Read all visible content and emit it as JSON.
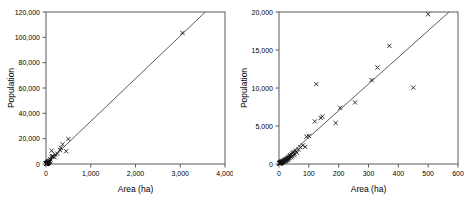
{
  "figure": {
    "panel_count": 2,
    "background_color": "#ffffff",
    "axis_color": "#5a5a5a",
    "marker_color": "#111111",
    "line_color": "#4a4a4a"
  },
  "chart_data": [
    {
      "type": "scatter",
      "title": "",
      "xlabel": "Area (ha)",
      "ylabel": "Population",
      "xlim": [
        0,
        4000
      ],
      "ylim": [
        0,
        120000
      ],
      "xticks": [
        0,
        1000,
        2000,
        3000,
        4000
      ],
      "xticklabels": [
        "0",
        "1,000",
        "2,000",
        "3,000",
        "4,000"
      ],
      "yticks": [
        0,
        20000,
        40000,
        60000,
        80000,
        100000,
        120000
      ],
      "yticklabels": [
        "0",
        "20,000",
        "40,000",
        "60,000",
        "80,000",
        "100,000",
        "120,000"
      ],
      "grid": false,
      "legend": false,
      "marker": "x",
      "fit_line": {
        "type": "linear",
        "x_start": 0,
        "y_start": 0,
        "x_end": 3560,
        "y_end": 120000,
        "slope": 33.7,
        "intercept": 0
      },
      "points": [
        {
          "x": 3050,
          "y": 103500
        },
        {
          "x": 500,
          "y": 19700
        },
        {
          "x": 370,
          "y": 15550
        },
        {
          "x": 450,
          "y": 10050
        },
        {
          "x": 330,
          "y": 12700
        },
        {
          "x": 310,
          "y": 11050
        },
        {
          "x": 255,
          "y": 8100
        },
        {
          "x": 205,
          "y": 7400
        },
        {
          "x": 190,
          "y": 5400
        },
        {
          "x": 145,
          "y": 6250
        },
        {
          "x": 140,
          "y": 6050
        },
        {
          "x": 125,
          "y": 10500
        },
        {
          "x": 120,
          "y": 5600
        },
        {
          "x": 100,
          "y": 3700
        },
        {
          "x": 92,
          "y": 3600
        },
        {
          "x": 88,
          "y": 2250
        },
        {
          "x": 80,
          "y": 2450
        },
        {
          "x": 72,
          "y": 2200
        },
        {
          "x": 66,
          "y": 1900
        },
        {
          "x": 60,
          "y": 1500
        },
        {
          "x": 56,
          "y": 1750
        },
        {
          "x": 52,
          "y": 1350
        },
        {
          "x": 50,
          "y": 1150
        },
        {
          "x": 46,
          "y": 1400
        },
        {
          "x": 44,
          "y": 1000
        },
        {
          "x": 40,
          "y": 900
        },
        {
          "x": 36,
          "y": 1050
        },
        {
          "x": 34,
          "y": 700
        },
        {
          "x": 30,
          "y": 800
        },
        {
          "x": 28,
          "y": 600
        },
        {
          "x": 25,
          "y": 650
        },
        {
          "x": 22,
          "y": 480
        },
        {
          "x": 20,
          "y": 520
        },
        {
          "x": 18,
          "y": 380
        },
        {
          "x": 16,
          "y": 420
        },
        {
          "x": 14,
          "y": 300
        },
        {
          "x": 12,
          "y": 330
        },
        {
          "x": 10,
          "y": 250
        },
        {
          "x": 9,
          "y": 280
        },
        {
          "x": 8,
          "y": 200
        },
        {
          "x": 7,
          "y": 220
        },
        {
          "x": 6,
          "y": 160
        },
        {
          "x": 5,
          "y": 180
        },
        {
          "x": 4,
          "y": 120
        },
        {
          "x": 3,
          "y": 140
        },
        {
          "x": 2,
          "y": 90
        },
        {
          "x": 1.5,
          "y": 70
        }
      ]
    },
    {
      "type": "scatter",
      "title": "",
      "xlabel": "Area (ha)",
      "ylabel": "Population",
      "xlim": [
        0,
        600
      ],
      "ylim": [
        0,
        20000
      ],
      "xticks": [
        0,
        100,
        200,
        300,
        400,
        500,
        600
      ],
      "xticklabels": [
        "0",
        "100",
        "200",
        "300",
        "400",
        "500",
        "600"
      ],
      "yticks": [
        0,
        5000,
        10000,
        15000,
        20000
      ],
      "yticklabels": [
        "0",
        "5,000",
        "10,000",
        "15,000",
        "20,000"
      ],
      "grid": false,
      "legend": false,
      "marker": "x",
      "fit_line": {
        "type": "linear",
        "x_start": 0,
        "y_start": 0,
        "x_end": 570,
        "y_end": 20000,
        "slope": 35.1,
        "intercept": 0
      },
      "points": [
        {
          "x": 500,
          "y": 19700
        },
        {
          "x": 370,
          "y": 15550
        },
        {
          "x": 450,
          "y": 10050
        },
        {
          "x": 330,
          "y": 12700
        },
        {
          "x": 310,
          "y": 11050
        },
        {
          "x": 255,
          "y": 8100
        },
        {
          "x": 205,
          "y": 7400
        },
        {
          "x": 190,
          "y": 5400
        },
        {
          "x": 145,
          "y": 6250
        },
        {
          "x": 140,
          "y": 6050
        },
        {
          "x": 125,
          "y": 10500
        },
        {
          "x": 120,
          "y": 5600
        },
        {
          "x": 100,
          "y": 3700
        },
        {
          "x": 92,
          "y": 3600
        },
        {
          "x": 88,
          "y": 2250
        },
        {
          "x": 80,
          "y": 2450
        },
        {
          "x": 72,
          "y": 2200
        },
        {
          "x": 66,
          "y": 1900
        },
        {
          "x": 60,
          "y": 1500
        },
        {
          "x": 56,
          "y": 1750
        },
        {
          "x": 52,
          "y": 1350
        },
        {
          "x": 50,
          "y": 1150
        },
        {
          "x": 48,
          "y": 1600
        },
        {
          "x": 46,
          "y": 1400
        },
        {
          "x": 44,
          "y": 1000
        },
        {
          "x": 42,
          "y": 1250
        },
        {
          "x": 40,
          "y": 900
        },
        {
          "x": 38,
          "y": 1150
        },
        {
          "x": 36,
          "y": 1050
        },
        {
          "x": 35,
          "y": 800
        },
        {
          "x": 34,
          "y": 700
        },
        {
          "x": 32,
          "y": 950
        },
        {
          "x": 30,
          "y": 800
        },
        {
          "x": 29,
          "y": 620
        },
        {
          "x": 28,
          "y": 600
        },
        {
          "x": 27,
          "y": 750
        },
        {
          "x": 26,
          "y": 500
        },
        {
          "x": 25,
          "y": 650
        },
        {
          "x": 24,
          "y": 560
        },
        {
          "x": 23,
          "y": 430
        },
        {
          "x": 22,
          "y": 480
        },
        {
          "x": 21,
          "y": 600
        },
        {
          "x": 20,
          "y": 520
        },
        {
          "x": 19,
          "y": 350
        },
        {
          "x": 18,
          "y": 380
        },
        {
          "x": 17,
          "y": 470
        },
        {
          "x": 16,
          "y": 420
        },
        {
          "x": 15,
          "y": 280
        },
        {
          "x": 14,
          "y": 300
        },
        {
          "x": 13,
          "y": 390
        },
        {
          "x": 12,
          "y": 330
        },
        {
          "x": 11,
          "y": 230
        },
        {
          "x": 10,
          "y": 250
        },
        {
          "x": 9.5,
          "y": 310
        },
        {
          "x": 9,
          "y": 280
        },
        {
          "x": 8.5,
          "y": 190
        },
        {
          "x": 8,
          "y": 200
        },
        {
          "x": 7.5,
          "y": 260
        },
        {
          "x": 7,
          "y": 220
        },
        {
          "x": 6.5,
          "y": 150
        },
        {
          "x": 6,
          "y": 160
        },
        {
          "x": 5.5,
          "y": 210
        },
        {
          "x": 5,
          "y": 180
        },
        {
          "x": 4.5,
          "y": 110
        },
        {
          "x": 4,
          "y": 120
        },
        {
          "x": 3.5,
          "y": 170
        },
        {
          "x": 3,
          "y": 140
        },
        {
          "x": 2.5,
          "y": 80
        },
        {
          "x": 2,
          "y": 90
        },
        {
          "x": 1.5,
          "y": 70
        },
        {
          "x": 1,
          "y": 50
        }
      ]
    }
  ]
}
